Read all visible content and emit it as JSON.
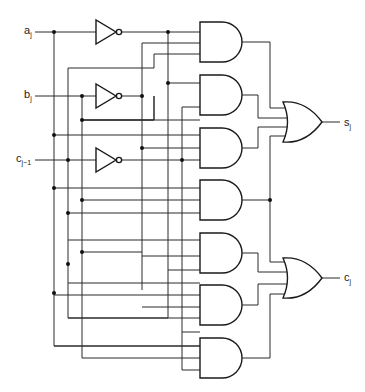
{
  "diagram": {
    "inputs": [
      {
        "id": "a",
        "label": "a",
        "sub": "j"
      },
      {
        "id": "b",
        "label": "b",
        "sub": "j"
      },
      {
        "id": "c",
        "label": "c",
        "sub": "j−1"
      }
    ],
    "outputs": [
      {
        "id": "s",
        "label": "s",
        "sub": "j"
      },
      {
        "id": "cout",
        "label": "c",
        "sub": "j"
      }
    ],
    "gates": {
      "not": [
        "NOT a",
        "NOT b",
        "NOT c"
      ],
      "and": [
        "AND1",
        "AND2",
        "AND3",
        "AND4",
        "AND5",
        "AND6",
        "AND7"
      ],
      "or": [
        "OR sum",
        "OR carry"
      ]
    },
    "colors": {
      "line": "#2a2a2a",
      "background": "#ffffff"
    }
  }
}
